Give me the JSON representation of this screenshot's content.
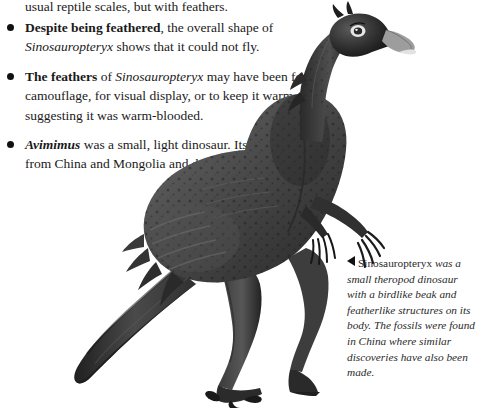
{
  "page": {
    "background_color": "#ffffff",
    "text_color": "#1a1a1a"
  },
  "body_text": {
    "partial_top_line": "usual reptile scales, but with feathers.",
    "bullets": [
      {
        "lead_bold": "Despite being feathered",
        "text_after_lead": ", the overall shape of ",
        "italic_term": "Sinosauropteryx",
        "text_tail": " shows that it could not fly."
      },
      {
        "lead_bold": "The feathers",
        "text_after_lead": " of ",
        "italic_term": "Sinosauropteryx",
        "text_tail": " may have been for camouflage, for visual display, or to keep it warm—suggesting it was warm-blooded."
      },
      {
        "lead_bold_italic": "Avimimus",
        "text_tail": " was a small, light dinosaur. Its fossils come from China and Mongolia and date from 85–82 mya."
      }
    ]
  },
  "caption": {
    "marker": "left-triangle",
    "roman_term": "Sinosauropteryx",
    "text": " was a small theropod dinosaur with a birdlike beak and featherlike structures on its body. The fossils were found in China where similar discoveries have also been made."
  },
  "illustration": {
    "subject": "sinosauropteryx-dinosaur",
    "style": "greyscale-halftone-drawing",
    "colors": {
      "darkest": "#1c1c1c",
      "dark": "#333333",
      "mid": "#6a6a6a",
      "light": "#9a9a9a",
      "beak_highlight": "#d8d8d8"
    }
  }
}
